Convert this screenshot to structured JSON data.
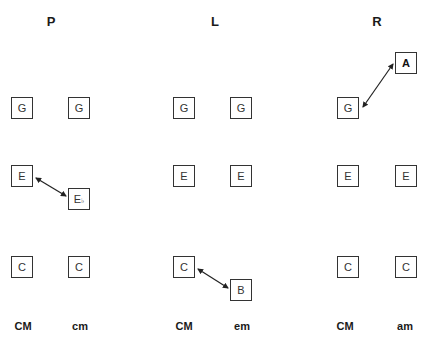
{
  "panels": [
    {
      "title": "P",
      "left_chord": "CM",
      "right_chord": "cm",
      "left_notes": [
        "G",
        "E",
        "C"
      ],
      "right_notes": [
        "G",
        "E",
        "C"
      ],
      "right_flat": "♭",
      "transform": {
        "from": "E",
        "to": "E♭"
      }
    },
    {
      "title": "L",
      "left_chord": "CM",
      "right_chord": "em",
      "left_notes": [
        "G",
        "E",
        "C"
      ],
      "right_notes": [
        "G",
        "E",
        "B"
      ],
      "transform": {
        "from": "C",
        "to": "B"
      }
    },
    {
      "title": "R",
      "left_chord": "CM",
      "right_chord": "am",
      "left_notes": [
        "G",
        "E",
        "C"
      ],
      "right_notes": [
        "A",
        "E",
        "C"
      ],
      "transform": {
        "from": "G",
        "to": "A"
      }
    }
  ],
  "colors": {
    "stroke": "#333333",
    "background": "#ffffff"
  }
}
